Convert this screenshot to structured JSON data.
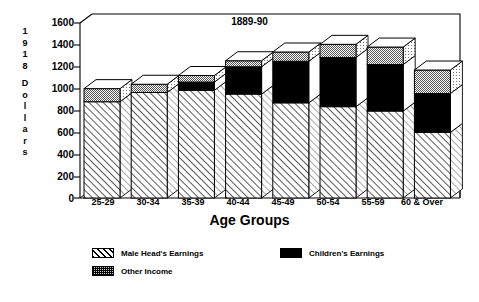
{
  "chart_data": {
    "type": "bar",
    "stacked": true,
    "three_d": true,
    "title": "1889-90",
    "xlabel": "Age Groups",
    "ylabel": "1918 Dollars",
    "ylabel_chars": [
      "1",
      "9",
      "1",
      "8",
      "",
      "D",
      "o",
      "l",
      "l",
      "a",
      "r",
      "s"
    ],
    "categories": [
      "25-29",
      "30-34",
      "35-39",
      "40-44",
      "45-49",
      "50-54",
      "55-59",
      "60 & Over"
    ],
    "ylim": [
      0,
      1600
    ],
    "yticks": [
      0,
      200,
      400,
      600,
      800,
      1000,
      1200,
      1400,
      1600
    ],
    "grid": false,
    "legend_position": "below-plot",
    "series": [
      {
        "name": "Male Head's Earnings",
        "pattern": "diagonal-hatch",
        "color": "#ffffff",
        "values": [
          880,
          965,
          985,
          950,
          870,
          835,
          795,
          600
        ]
      },
      {
        "name": "Children's Earnings",
        "pattern": "solid-black",
        "color": "#000000",
        "values": [
          0,
          0,
          75,
          250,
          380,
          450,
          425,
          355
        ]
      },
      {
        "name": "Other Income",
        "pattern": "gray-stipple",
        "color": "#c8c8c8",
        "values": [
          120,
          75,
          60,
          55,
          85,
          120,
          160,
          215
        ]
      }
    ],
    "totals": [
      1000,
      1040,
      1120,
      1255,
      1335,
      1405,
      1380,
      1170
    ]
  },
  "legend": {
    "items": [
      {
        "label": "Male Head's Earnings",
        "pattern": "diagonal-hatch"
      },
      {
        "label": "Children's Earnings",
        "pattern": "solid-black"
      },
      {
        "label": "Other Income",
        "pattern": "gray-stipple"
      }
    ]
  },
  "colors": {
    "axis": "#000000",
    "background": "#ffffff",
    "children": "#000000",
    "other_income": "#c8c8c8"
  }
}
